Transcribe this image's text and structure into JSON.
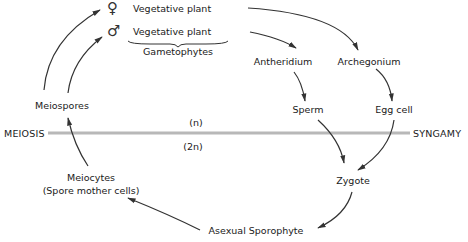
{
  "diagram": {
    "phase_line": {
      "left_label": "MEIOSIS",
      "right_label": "SYNGAMY",
      "upper_ploidy": "(n)",
      "lower_ploidy": "(2n)"
    },
    "gametophytes": {
      "female_symbol": "♀",
      "male_symbol": "♂",
      "female_label": "Vegetative plant",
      "male_label": "Vegetative plant",
      "group_label": "Gametophytes"
    },
    "nodes": {
      "antheridium": "Antheridium",
      "archegonium": "Archegonium",
      "sperm": "Sperm",
      "egg_cell": "Egg cell",
      "zygote": "Zygote",
      "asexual_sporophyte": "Asexual Sporophyte",
      "meiocytes": "Meiocytes",
      "meiocytes_sub": "(Spore mother cells)",
      "meiospores": "Meiospores"
    },
    "colors": {
      "line": "#b8b8b8",
      "arrow": "#333333",
      "text": "#1a1a1a"
    }
  }
}
